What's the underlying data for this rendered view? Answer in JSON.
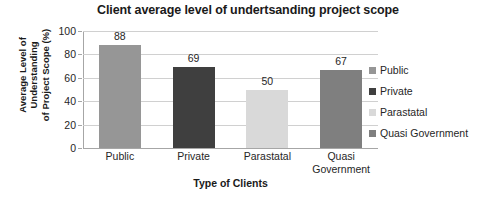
{
  "chart_data": {
    "type": "bar",
    "title": "Client average level of undertsanding project scope",
    "xlabel": "Type of Clients",
    "ylabel": "Average Level of Understanding of Project Scope (%)",
    "ylabel_lines": [
      "Average Level of",
      "Understanding",
      "of Project Scope (%)"
    ],
    "categories": [
      "Public",
      "Private",
      "Parastatal",
      "Quasi Government"
    ],
    "category_label_lines": [
      [
        "Public"
      ],
      [
        "Private"
      ],
      [
        "Parastatal"
      ],
      [
        "Quasi",
        "Government"
      ]
    ],
    "values": [
      88,
      69,
      50,
      67
    ],
    "data_labels": [
      "88",
      "69",
      "50",
      "67"
    ],
    "ylim": [
      0,
      100
    ],
    "yticks": [
      0,
      20,
      40,
      60,
      80,
      100
    ],
    "ytick_labels": [
      "0",
      "20",
      "40",
      "60",
      "80",
      "100"
    ],
    "grid": true,
    "grid_axis": "y",
    "legend_position": "right",
    "legend": [
      {
        "label": "Public",
        "color": "#969696"
      },
      {
        "label": "Private",
        "color": "#3f3f3f"
      },
      {
        "label": "Parastatal",
        "color": "#d9d9d9"
      },
      {
        "label": "Quasi Government",
        "color": "#7f7f7f"
      }
    ],
    "bar_colors": [
      "#969696",
      "#3f3f3f",
      "#d9d9d9",
      "#7f7f7f"
    ],
    "colors": {
      "background": "#ffffff",
      "text": "#262626",
      "title": "#1a1a1a",
      "gridline": "#d0d0d0",
      "axis": "#a6a6a6"
    }
  }
}
